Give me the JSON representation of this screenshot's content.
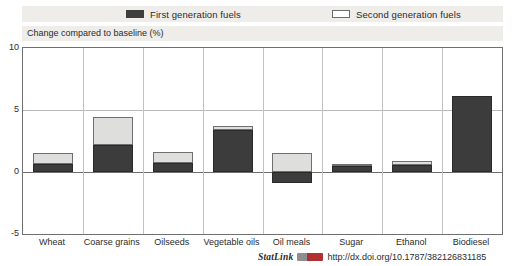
{
  "figure": {
    "title_partial": "",
    "caption": "Change compared to baseline (%)"
  },
  "legend": {
    "items": [
      {
        "label": "First generation fuels",
        "swatch": "dark-filled-rectangle",
        "color": "#3c3c3c"
      },
      {
        "label": "Second generation fuels",
        "swatch": "light-outlined-rectangle",
        "color": "#dedfdc"
      }
    ]
  },
  "footer": {
    "statlink_label": "StatLink",
    "badge": "statlink-badge-icon",
    "url": "http://dx.doi.org/10.1787/382126831185"
  },
  "chart_data": {
    "type": "bar",
    "title": "",
    "subtitle": "",
    "xlabel": "",
    "ylabel": "Change compared to baseline (%)",
    "ylim": [
      -5,
      10
    ],
    "yticks": [
      10,
      5,
      0,
      -5
    ],
    "ytick_labels": [
      "10",
      "5",
      "0",
      "-5"
    ],
    "grid": true,
    "legend_position": "top",
    "stacked": true,
    "categories": [
      "Wheat",
      "Coarse grains",
      "Oilseeds",
      "Vegetable oils",
      "Oil meals",
      "Sugar",
      "Ethanol",
      "Biodiesel"
    ],
    "series": [
      {
        "name": "First generation fuels",
        "color": "#3c3c3c",
        "values": [
          0.65,
          2.2,
          0.7,
          3.4,
          -0.9,
          0.5,
          0.55,
          6.1
        ]
      },
      {
        "name": "Second generation fuels",
        "color": "#dedfdc",
        "values": [
          0.85,
          2.2,
          0.9,
          0.3,
          1.5,
          0.15,
          0.3,
          0.0
        ]
      }
    ],
    "totals": [
      1.5,
      4.4,
      1.6,
      3.7,
      0.6,
      0.65,
      0.85,
      6.1
    ]
  }
}
